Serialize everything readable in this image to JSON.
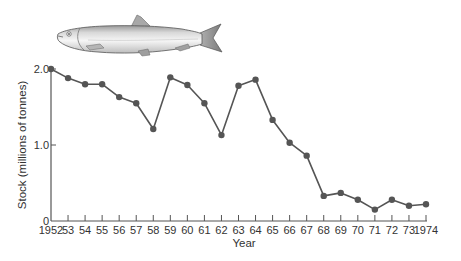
{
  "illustration": {
    "subject": "herring",
    "icon": "fish-icon"
  },
  "chart_data": {
    "type": "line",
    "title": "",
    "xlabel": "Year",
    "ylabel": "Stock (millions of tonnes)",
    "ylim": [
      0,
      2.0
    ],
    "xlim": [
      1952,
      1974
    ],
    "grid": false,
    "legend": null,
    "y_ticks": [
      {
        "value": 0,
        "label": "0"
      },
      {
        "value": 1.0,
        "label": "1.0"
      },
      {
        "value": 2.0,
        "label": "2.0"
      }
    ],
    "x_tick_labels": [
      "1952",
      "53",
      "54",
      "55",
      "56",
      "57",
      "58",
      "59",
      "60",
      "61",
      "62",
      "63",
      "64",
      "65",
      "66",
      "67",
      "68",
      "69",
      "70",
      "71",
      "72",
      "73",
      "1974"
    ],
    "x": [
      1952,
      1953,
      1954,
      1955,
      1956,
      1957,
      1958,
      1959,
      1960,
      1961,
      1962,
      1963,
      1964,
      1965,
      1966,
      1967,
      1968,
      1969,
      1970,
      1971,
      1972,
      1973,
      1974
    ],
    "series": [
      {
        "name": "Herring stock",
        "color": "#555555",
        "marker": "circle",
        "values": [
          2.0,
          1.88,
          1.8,
          1.8,
          1.63,
          1.55,
          1.21,
          1.89,
          1.79,
          1.55,
          1.13,
          1.78,
          1.86,
          1.33,
          1.03,
          0.86,
          0.33,
          0.37,
          0.28,
          0.15,
          0.28,
          0.2,
          0.22
        ]
      }
    ]
  },
  "colors": {
    "line": "#555555",
    "marker": "#555555",
    "axis": "#555555",
    "text": "#333333"
  }
}
